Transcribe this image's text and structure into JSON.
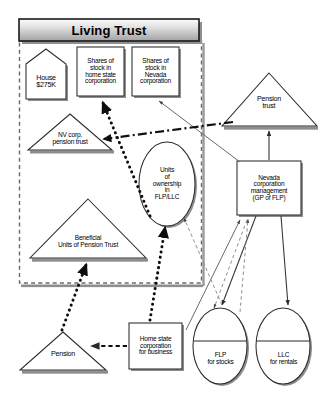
{
  "diagram": {
    "title": "Living Trust",
    "container": {
      "label": "living-trust-boundary",
      "style": "dashed"
    },
    "nodes": [
      {
        "id": "house",
        "shape": "house",
        "text": "House\n$275K"
      },
      {
        "id": "shares-home",
        "shape": "rect",
        "text": "Shares of\nstock in\nhome state\ncorporation"
      },
      {
        "id": "shares-nevada",
        "shape": "rect",
        "text": "Shares of\nstock in\nNevada\ncorporation"
      },
      {
        "id": "nv-corp-pension",
        "shape": "triangle",
        "text": "NV corp.\npension trust"
      },
      {
        "id": "units-ownership",
        "shape": "ellipse",
        "text": "Units\nof\nownership\nin\nFLP/LLC"
      },
      {
        "id": "beneficial-units",
        "shape": "triangle",
        "text": "Beneficial\nUnits of Pension Trust"
      },
      {
        "id": "pension-trust",
        "shape": "triangle",
        "text": "Pension\ntrust"
      },
      {
        "id": "nevada-corp-mgmt",
        "shape": "rect",
        "text": "Nevada\ncorporation\nmanagement\n(GP of FLP)"
      },
      {
        "id": "pension",
        "shape": "triangle",
        "text": "Pension"
      },
      {
        "id": "home-state-corp",
        "shape": "rect",
        "text": "Home state\ncorporation\nfor business"
      },
      {
        "id": "flp",
        "shape": "cylinder",
        "text": "FLP\nfor stocks"
      },
      {
        "id": "llc",
        "shape": "cylinder",
        "text": "LLC\nfor rentals"
      }
    ],
    "connectors": [
      {
        "from": "units-ownership",
        "to": "shares-home",
        "style": "dotted-thick"
      },
      {
        "from": "units-ownership",
        "to": "beneficial-units",
        "style": "dotted-thick"
      },
      {
        "from": "home-state-corp",
        "to": "units-ownership",
        "style": "dotted-thick"
      },
      {
        "from": "pension-trust",
        "to": "nv-corp-pension",
        "style": "dash-dot"
      },
      {
        "from": "home-state-corp",
        "to": "pension",
        "style": "dashed"
      },
      {
        "from": "nevada-corp-mgmt",
        "to": "pension-trust",
        "style": "solid"
      },
      {
        "from": "nevada-corp-mgmt",
        "to": "shares-nevada",
        "style": "solid"
      },
      {
        "from": "nevada-corp-mgmt",
        "to": "flp",
        "style": "solid"
      },
      {
        "from": "nevada-corp-mgmt",
        "to": "llc",
        "style": "solid"
      },
      {
        "from": "flp",
        "to": "nevada-corp-mgmt",
        "style": "solid"
      },
      {
        "from": "flp",
        "to": "units-ownership",
        "style": "dashed-thin"
      },
      {
        "from": "llc",
        "to": "units-ownership",
        "style": "dashed-thin"
      },
      {
        "from": "nevada-corp-mgmt",
        "to": "flp",
        "style": "dashed-thin"
      }
    ],
    "colors": {
      "title_fill_top": "#f2f2f2",
      "title_fill_bottom": "#a8a8a8",
      "node_fill": "#ffffff",
      "stroke": "#222222",
      "shadow": "#8c8c8c",
      "boundary": "#555555"
    }
  }
}
